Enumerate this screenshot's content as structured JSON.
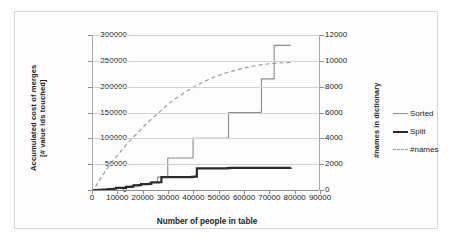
{
  "axes": {
    "y_left_title": "Accumulated cost of merges\n[# value ids touched]",
    "y_right_title": "#names in dictionary",
    "x_title": "Number of people in table",
    "y_left_ticks": [
      "0",
      "50000",
      "100000",
      "150000",
      "200000",
      "250000",
      "300000"
    ],
    "y_right_ticks": [
      "0",
      "2000",
      "4000",
      "6000",
      "8000",
      "10000",
      "12000"
    ],
    "x_ticks": [
      "0",
      "10000",
      "20000",
      "30000",
      "40000",
      "50000",
      "60000",
      "70000",
      "80000",
      "90000"
    ]
  },
  "legend": {
    "items": [
      {
        "label": "Sorted",
        "color": "#8c8c8c",
        "style": "solid-thin"
      },
      {
        "label": "Split",
        "color": "#2b2b2b",
        "style": "solid-thick"
      },
      {
        "label": "#names",
        "color": "#9a9a9a",
        "style": "dashed"
      }
    ]
  },
  "chart_data": {
    "type": "line",
    "title": "",
    "xlabel": "Number of people in table",
    "ylabel": "Accumulated cost of merges [# value ids touched]",
    "y2label": "#names in dictionary",
    "xlim": [
      0,
      90000
    ],
    "ylim": [
      0,
      300000
    ],
    "y2lim": [
      0,
      12000
    ],
    "grid": true,
    "legend_position": "right",
    "series": [
      {
        "name": "Sorted",
        "axis": "left",
        "style": "step",
        "color": "#8c8c8c",
        "points": [
          [
            0,
            0
          ],
          [
            2000,
            500
          ],
          [
            4000,
            1200
          ],
          [
            6000,
            2000
          ],
          [
            8000,
            2600
          ],
          [
            9000,
            4500
          ],
          [
            12000,
            4800
          ],
          [
            13000,
            6500
          ],
          [
            15000,
            7000
          ],
          [
            16000,
            9500
          ],
          [
            18000,
            10000
          ],
          [
            19000,
            12500
          ],
          [
            22000,
            13000
          ],
          [
            23000,
            16000
          ],
          [
            25000,
            17000
          ],
          [
            25500,
            25000
          ],
          [
            29000,
            25500
          ],
          [
            29500,
            62000
          ],
          [
            39000,
            62500
          ],
          [
            39500,
            100000
          ],
          [
            53000,
            100500
          ],
          [
            53500,
            150000
          ],
          [
            66000,
            150500
          ],
          [
            66500,
            215000
          ],
          [
            71000,
            215500
          ],
          [
            71500,
            280000
          ],
          [
            78000,
            280000
          ]
        ]
      },
      {
        "name": "Split",
        "axis": "left",
        "style": "step",
        "color": "#2b2b2b",
        "points": [
          [
            0,
            0
          ],
          [
            2000,
            400
          ],
          [
            4000,
            1000
          ],
          [
            6000,
            1800
          ],
          [
            8000,
            2400
          ],
          [
            9000,
            4000
          ],
          [
            12000,
            4300
          ],
          [
            13000,
            6000
          ],
          [
            15000,
            6500
          ],
          [
            16000,
            8800
          ],
          [
            18000,
            9300
          ],
          [
            19000,
            11500
          ],
          [
            22000,
            12000
          ],
          [
            23000,
            14500
          ],
          [
            26000,
            15000
          ],
          [
            27000,
            25000
          ],
          [
            39000,
            25500
          ],
          [
            40000,
            26000
          ],
          [
            41000,
            42000
          ],
          [
            53000,
            42500
          ],
          [
            54000,
            43000
          ],
          [
            78000,
            43500
          ]
        ]
      },
      {
        "name": "#names",
        "axis": "right",
        "style": "smooth",
        "color": "#9a9a9a",
        "points": [
          [
            1000,
            250
          ],
          [
            3000,
            900
          ],
          [
            5000,
            1500
          ],
          [
            8000,
            2300
          ],
          [
            11000,
            3000
          ],
          [
            14000,
            3700
          ],
          [
            18000,
            4500
          ],
          [
            22000,
            5300
          ],
          [
            26000,
            6000
          ],
          [
            30000,
            6700
          ],
          [
            35000,
            7400
          ],
          [
            40000,
            8000
          ],
          [
            45000,
            8500
          ],
          [
            50000,
            8900
          ],
          [
            55000,
            9200
          ],
          [
            60000,
            9450
          ],
          [
            65000,
            9650
          ],
          [
            70000,
            9780
          ],
          [
            75000,
            9850
          ],
          [
            78000,
            9880
          ]
        ]
      }
    ]
  }
}
